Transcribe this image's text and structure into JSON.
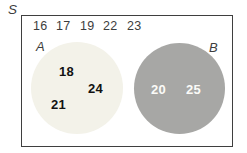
{
  "figure": {
    "type": "venn-diagram",
    "universal_label": "S",
    "outside_row": [
      "16",
      "17",
      "19",
      "22",
      "23"
    ],
    "set_a": {
      "label": "A",
      "elements": [
        "18",
        "24",
        "21"
      ],
      "fill": "#f3f2e9"
    },
    "set_b": {
      "label": "B",
      "elements": [
        "20",
        "25"
      ],
      "fill": "#a7a7a5"
    },
    "colors": {
      "frame_border": "#3f3f3f",
      "text": "#3d3d3d",
      "set_a_text": "#121212",
      "set_b_text": "#fbfbf8"
    }
  }
}
